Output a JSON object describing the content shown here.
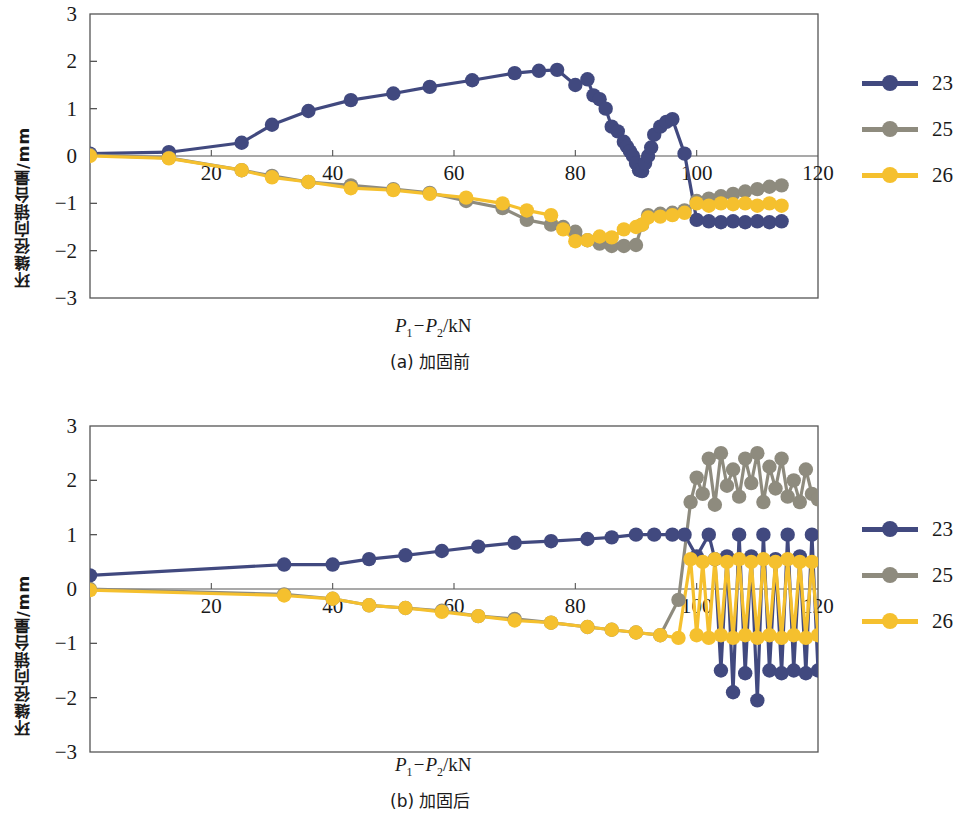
{
  "colors": {
    "series_23": "#41497f",
    "series_25": "#8e8b7e",
    "series_26": "#f5c02e",
    "axis": "#555555",
    "text": "#1a1a1a"
  },
  "legend": {
    "entries": [
      {
        "label": "23",
        "color": "#41497f"
      },
      {
        "label": "25",
        "color": "#8e8b7e"
      },
      {
        "label": "26",
        "color": "#f5c02e"
      }
    ]
  },
  "figure_a": {
    "caption": "(a) 加固前",
    "xlabel_prefix": "P",
    "xlabel_sub1": "1",
    "xlabel_mid": "−P",
    "xlabel_sub2": "2",
    "xlabel_suffix": "/kN",
    "ylabel": "环缝径向错台量/mm"
  },
  "figure_b": {
    "caption": "(b) 加固后",
    "xlabel_prefix": "P",
    "xlabel_sub1": "1",
    "xlabel_mid": "−P",
    "xlabel_sub2": "2",
    "xlabel_suffix": "/kN",
    "ylabel": "环缝径向错台量/mm"
  },
  "chart_data": [
    {
      "id": "figure-a",
      "type": "line",
      "title": "(a) 加固前",
      "xlabel": "P1−P2/kN",
      "ylabel": "环缝径向错台量/mm",
      "xlim": [
        0,
        120
      ],
      "ylim": [
        -3,
        3
      ],
      "xticks": [
        20,
        40,
        60,
        80,
        100,
        120
      ],
      "yticks": [
        -3,
        -2,
        -1,
        0,
        1,
        2,
        3
      ],
      "grid": false,
      "legend_position": "right",
      "series": [
        {
          "name": "23",
          "color": "#41497f",
          "x": [
            0,
            13,
            25,
            30,
            36,
            43,
            50,
            56,
            63,
            70,
            74,
            77,
            80,
            82,
            83,
            84,
            85,
            86,
            87,
            88,
            88.5,
            89,
            89.5,
            90,
            90.5,
            91,
            91.5,
            92,
            92.5,
            93,
            94,
            95,
            96,
            98,
            100,
            102,
            104,
            106,
            108,
            110,
            112,
            114
          ],
          "y": [
            0.05,
            0.08,
            0.28,
            0.66,
            0.95,
            1.18,
            1.32,
            1.46,
            1.6,
            1.75,
            1.8,
            1.82,
            1.5,
            1.62,
            1.28,
            1.2,
            1.0,
            0.62,
            0.52,
            0.3,
            0.2,
            0.1,
            0.0,
            -0.15,
            -0.3,
            -0.32,
            -0.15,
            0.0,
            0.18,
            0.45,
            0.62,
            0.72,
            0.78,
            0.05,
            -1.35,
            -1.38,
            -1.4,
            -1.38,
            -1.4,
            -1.38,
            -1.4,
            -1.38
          ]
        },
        {
          "name": "25",
          "color": "#8e8b7e",
          "x": [
            0,
            13,
            25,
            30,
            36,
            43,
            50,
            56,
            62,
            68,
            72,
            76,
            78,
            80,
            82,
            84,
            86,
            88,
            90,
            91,
            92,
            94,
            96,
            98,
            100,
            102,
            104,
            106,
            108,
            110,
            112,
            114
          ],
          "y": [
            0.02,
            -0.04,
            -0.3,
            -0.42,
            -0.55,
            -0.62,
            -0.7,
            -0.78,
            -0.95,
            -1.1,
            -1.35,
            -1.45,
            -1.5,
            -1.6,
            -1.78,
            -1.85,
            -1.9,
            -1.9,
            -1.88,
            -1.45,
            -1.25,
            -1.22,
            -1.2,
            -1.15,
            -0.95,
            -0.9,
            -0.85,
            -0.8,
            -0.75,
            -0.7,
            -0.65,
            -0.62
          ]
        },
        {
          "name": "26",
          "color": "#f5c02e",
          "x": [
            0,
            13,
            25,
            30,
            36,
            43,
            50,
            56,
            62,
            68,
            72,
            76,
            78,
            80,
            82,
            84,
            86,
            88,
            90,
            91,
            92,
            94,
            96,
            98,
            100,
            102,
            104,
            106,
            108,
            110,
            112,
            114
          ],
          "y": [
            0.0,
            -0.05,
            -0.3,
            -0.45,
            -0.55,
            -0.68,
            -0.72,
            -0.8,
            -0.88,
            -1.0,
            -1.15,
            -1.25,
            -1.55,
            -1.8,
            -1.78,
            -1.7,
            -1.72,
            -1.55,
            -1.5,
            -1.45,
            -1.3,
            -1.28,
            -1.25,
            -1.2,
            -1.0,
            -1.05,
            -1.0,
            -1.02,
            -1.0,
            -1.05,
            -1.0,
            -1.05
          ]
        }
      ]
    },
    {
      "id": "figure-b",
      "type": "line",
      "title": "(b) 加固后",
      "xlabel": "P1−P2/kN",
      "ylabel": "环缝径向错台量/mm",
      "xlim": [
        0,
        120
      ],
      "ylim": [
        -3,
        3
      ],
      "xticks": [
        20,
        40,
        60,
        80,
        100,
        120
      ],
      "yticks": [
        -3,
        -2,
        -1,
        0,
        1,
        2,
        3
      ],
      "grid": false,
      "legend_position": "right",
      "series": [
        {
          "name": "23",
          "color": "#41497f",
          "x": [
            0,
            32,
            40,
            46,
            52,
            58,
            64,
            70,
            76,
            82,
            86,
            90,
            93,
            96,
            98,
            100,
            102,
            103,
            104,
            105,
            106,
            107,
            108,
            109,
            110,
            111,
            112,
            113,
            114,
            115,
            116,
            117,
            118,
            119,
            120
          ],
          "y": [
            0.25,
            0.45,
            0.45,
            0.55,
            0.62,
            0.7,
            0.78,
            0.85,
            0.88,
            0.92,
            0.95,
            1.0,
            1.0,
            1.0,
            1.0,
            0.6,
            1.0,
            0.55,
            -1.5,
            0.6,
            -1.9,
            1.0,
            -1.55,
            0.6,
            -2.05,
            1.0,
            -1.5,
            0.55,
            -1.55,
            1.0,
            -1.5,
            0.6,
            -1.55,
            1.0,
            -1.5
          ]
        },
        {
          "name": "25",
          "color": "#8e8b7e",
          "x": [
            0,
            32,
            40,
            46,
            52,
            58,
            64,
            70,
            76,
            82,
            86,
            90,
            94,
            97,
            99,
            100,
            101,
            102,
            103,
            104,
            105,
            106,
            107,
            108,
            109,
            110,
            111,
            112,
            113,
            114,
            115,
            116,
            117,
            118,
            119,
            120
          ],
          "y": [
            0.0,
            -0.1,
            -0.18,
            -0.3,
            -0.35,
            -0.4,
            -0.5,
            -0.55,
            -0.62,
            -0.7,
            -0.75,
            -0.8,
            -0.85,
            -0.2,
            1.6,
            2.05,
            1.75,
            2.4,
            1.55,
            2.5,
            1.9,
            2.2,
            1.7,
            2.4,
            1.95,
            2.5,
            1.6,
            2.25,
            1.85,
            2.4,
            1.7,
            2.0,
            1.6,
            2.2,
            1.75,
            1.65
          ]
        },
        {
          "name": "26",
          "color": "#f5c02e",
          "x": [
            0,
            32,
            40,
            46,
            52,
            58,
            64,
            70,
            76,
            82,
            86,
            90,
            94,
            97,
            99,
            100,
            101,
            102,
            103,
            104,
            105,
            106,
            107,
            108,
            109,
            110,
            111,
            112,
            113,
            114,
            115,
            116,
            117,
            118,
            119,
            120
          ],
          "y": [
            -0.02,
            -0.12,
            -0.18,
            -0.3,
            -0.35,
            -0.42,
            -0.5,
            -0.58,
            -0.62,
            -0.7,
            -0.75,
            -0.8,
            -0.85,
            -0.9,
            0.55,
            -0.85,
            0.5,
            -0.9,
            0.55,
            -0.85,
            0.5,
            -0.9,
            0.55,
            -0.85,
            0.5,
            -0.9,
            0.55,
            -0.85,
            0.5,
            -0.9,
            0.55,
            -0.85,
            0.5,
            -0.9,
            0.5,
            -0.85
          ]
        }
      ]
    }
  ]
}
